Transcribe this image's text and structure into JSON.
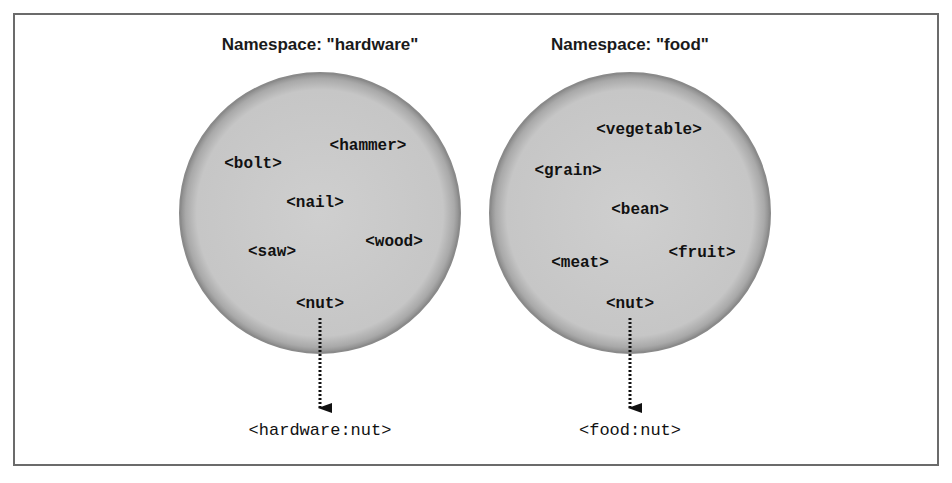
{
  "namespaces": [
    {
      "title": "Namespace: \"hardware\"",
      "elements": [
        "<hammer>",
        "<bolt>",
        "<nail>",
        "<wood>",
        "<saw>",
        "<nut>"
      ],
      "qualified_name": "<hardware:nut>"
    },
    {
      "title": "Namespace: \"food\"",
      "elements": [
        "<vegetable>",
        "<grain>",
        "<bean>",
        "<fruit>",
        "<meat>",
        "<nut>"
      ],
      "qualified_name": "<food:nut>"
    }
  ],
  "colors": {
    "circle_fill": "#c9c9c9",
    "circle_edge": "#8a8a8a",
    "frame": "#6b6b6b",
    "text": "#111111"
  }
}
